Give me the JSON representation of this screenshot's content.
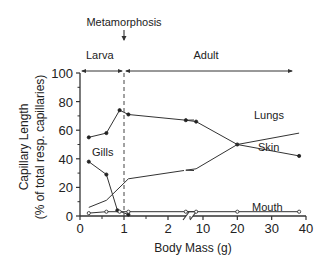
{
  "chart_data": {
    "type": "line",
    "title": "",
    "xlabel": "Body Mass (g)",
    "ylabel_line1": "Capillary Length",
    "ylabel_line2": "(% of total resp. capillaries)",
    "ylim": [
      0,
      100
    ],
    "yticks": [
      0,
      20,
      40,
      60,
      80,
      100
    ],
    "xticks_left": [
      0,
      1,
      2
    ],
    "xticks_right": [
      10,
      20,
      30,
      40
    ],
    "x_axis_break": true,
    "grid": false,
    "annotations": {
      "metamorphosis": "Metamorphosis",
      "larva": "Larva",
      "adult": "Adult",
      "metamorphosis_x": 1
    },
    "series": [
      {
        "name": "Skin",
        "marker": "filled",
        "points": [
          [
            0.2,
            55
          ],
          [
            0.6,
            58
          ],
          [
            0.9,
            74
          ],
          [
            1.1,
            71
          ],
          [
            5,
            67
          ],
          [
            8,
            66
          ],
          [
            20,
            50
          ],
          [
            38,
            42
          ]
        ]
      },
      {
        "name": "Lungs",
        "marker": "none",
        "points": [
          [
            0.2,
            6
          ],
          [
            0.6,
            11
          ],
          [
            1.1,
            26
          ],
          [
            5,
            32
          ],
          [
            8,
            33
          ],
          [
            20,
            50
          ],
          [
            38,
            58
          ]
        ]
      },
      {
        "name": "Gills",
        "marker": "filled",
        "points": [
          [
            0.2,
            38
          ],
          [
            0.6,
            29
          ],
          [
            0.85,
            4
          ],
          [
            1.1,
            1
          ]
        ]
      },
      {
        "name": "Mouth",
        "marker": "open",
        "points": [
          [
            0.2,
            2
          ],
          [
            0.6,
            3
          ],
          [
            0.9,
            3
          ],
          [
            1.1,
            3
          ],
          [
            5,
            3
          ],
          [
            8,
            3
          ],
          [
            20,
            3
          ],
          [
            38,
            3
          ]
        ]
      }
    ],
    "labels": {
      "Skin": "Skin",
      "Lungs": "Lungs",
      "Gills": "Gills",
      "Mouth": "Mouth"
    }
  }
}
